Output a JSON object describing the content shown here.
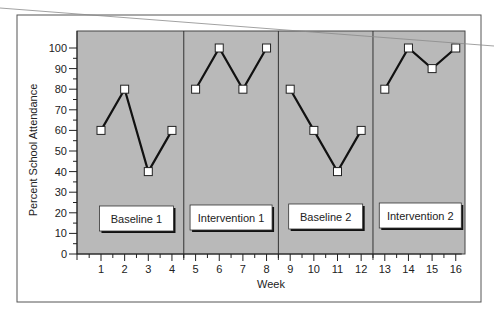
{
  "chart_data": {
    "type": "line",
    "title": "",
    "xlabel": "Week",
    "ylabel": "Percent School Attendance",
    "ylim": [
      0,
      100
    ],
    "yticks": [
      0,
      10,
      20,
      30,
      40,
      50,
      60,
      70,
      80,
      90,
      100
    ],
    "xticks": [
      1,
      2,
      3,
      4,
      5,
      6,
      7,
      8,
      9,
      10,
      11,
      12,
      13,
      14,
      15,
      16
    ],
    "grid": false,
    "legend": null,
    "phases": [
      {
        "label": "Baseline 1",
        "weeks": [
          1,
          2,
          3,
          4
        ],
        "values": [
          60,
          80,
          40,
          60
        ]
      },
      {
        "label": "Intervention 1",
        "weeks": [
          5,
          6,
          7,
          8
        ],
        "values": [
          80,
          100,
          80,
          100
        ]
      },
      {
        "label": "Baseline 2",
        "weeks": [
          9,
          10,
          11,
          12
        ],
        "values": [
          80,
          60,
          40,
          60
        ]
      },
      {
        "label": "Intervention 2",
        "weeks": [
          13,
          14,
          15,
          16
        ],
        "values": [
          80,
          100,
          90,
          100
        ]
      }
    ],
    "phase_dividers_after_week": [
      4,
      8,
      12
    ],
    "colors": {
      "plot_background": "#b9b9b9",
      "line": "#111111",
      "marker_fill": "#ffffff",
      "frame": "#666666"
    }
  }
}
